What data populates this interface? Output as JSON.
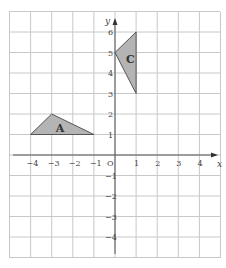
{
  "diagram": {
    "type": "coordinate-grid",
    "x_range": [
      -4,
      5
    ],
    "y_range": [
      -4,
      6
    ],
    "axes": {
      "x_label": "x",
      "y_label": "y",
      "origin_label": "O"
    },
    "x_ticks": [
      "-4",
      "-3",
      "-2",
      "-1",
      "1",
      "2",
      "3",
      "4"
    ],
    "y_ticks": [
      "6",
      "5",
      "4",
      "3",
      "2",
      "1",
      "-1",
      "-2",
      "-3",
      "-4"
    ],
    "shapes": [
      {
        "label": "A",
        "vertices": [
          [
            -4,
            1
          ],
          [
            -3,
            2
          ],
          [
            -1,
            1
          ]
        ],
        "fill": "#b4b4b4"
      },
      {
        "label": "C",
        "vertices": [
          [
            0,
            5
          ],
          [
            1,
            6
          ],
          [
            1,
            3
          ]
        ],
        "fill": "#b4b4b4"
      }
    ],
    "colors": {
      "grid": "#c8c8c8",
      "axis": "#555555",
      "shape_fill": "#b4b4b4"
    }
  }
}
